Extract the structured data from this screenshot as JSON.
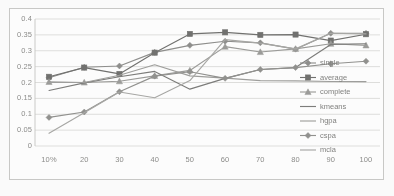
{
  "chart_data": {
    "type": "line",
    "title": "",
    "xlabel": "",
    "ylabel": "",
    "grid": true,
    "legend_position": "inside-right",
    "categories": [
      "10%",
      "20",
      "30",
      "40",
      "50",
      "60",
      "70",
      "80",
      "90",
      "100"
    ],
    "xlim": [
      0,
      9
    ],
    "ylim": [
      0,
      0.4
    ],
    "ytick_labels": [
      "0.4",
      "0.35",
      "0.3",
      "0.25",
      "0.2",
      "0.15",
      "0.1",
      "0.05",
      "0"
    ],
    "ytick_values": [
      0.4,
      0.35,
      0.3,
      0.25,
      0.2,
      0.15,
      0.1,
      0.05,
      0
    ],
    "series": [
      {
        "name": "single",
        "marker": "diamond",
        "color": "#8c8c88",
        "values": [
          0.215,
          0.248,
          0.252,
          0.295,
          0.317,
          0.33,
          0.325,
          0.305,
          0.355,
          0.355
        ]
      },
      {
        "name": "average",
        "marker": "square",
        "color": "#6e6e6a",
        "values": [
          0.218,
          0.247,
          0.227,
          0.294,
          0.353,
          0.358,
          0.35,
          0.351,
          0.332,
          0.352
        ]
      },
      {
        "name": "complete",
        "marker": "triangle",
        "color": "#9a9a95",
        "values": [
          0.202,
          0.2,
          0.204,
          0.221,
          0.238,
          0.313,
          0.296,
          0.306,
          0.322,
          0.317
        ]
      },
      {
        "name": "kmeans",
        "marker": "none",
        "color": "#7a7a76",
        "values": [
          0.175,
          0.199,
          0.218,
          0.235,
          0.179,
          0.213,
          0.241,
          0.247,
          0.32,
          0.322
        ]
      },
      {
        "name": "hgpa",
        "marker": "none",
        "color": "#9d9d98",
        "values": [
          0.2,
          0.2,
          0.223,
          0.256,
          0.221,
          0.214,
          0.206,
          0.205,
          0.203,
          0.203
        ]
      },
      {
        "name": "cspa",
        "marker": "diamond",
        "color": "#8f8f8a",
        "values": [
          0.09,
          0.107,
          0.171,
          0.22,
          0.234,
          0.213,
          0.241,
          0.247,
          0.259,
          0.267
        ]
      },
      {
        "name": "mcla",
        "marker": "none",
        "color": "#a6a6a1",
        "values": [
          0.04,
          0.105,
          0.17,
          0.152,
          0.206,
          0.335,
          0.324,
          0.306,
          0.355,
          0.353
        ]
      }
    ]
  },
  "legend": {
    "items": [
      {
        "label": "single"
      },
      {
        "label": "average"
      },
      {
        "label": "complete"
      },
      {
        "label": "kmeans"
      },
      {
        "label": "hgpa"
      },
      {
        "label": "cspa"
      },
      {
        "label": "mcla"
      }
    ]
  }
}
